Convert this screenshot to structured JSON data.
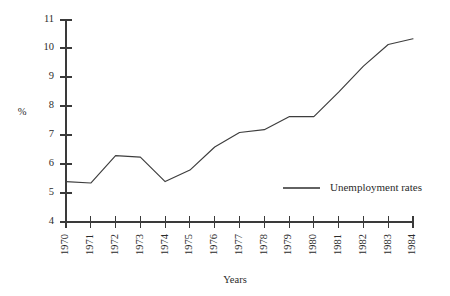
{
  "chart_data": {
    "type": "line",
    "title": "",
    "xlabel": "Years",
    "ylabel": "%",
    "categories": [
      "1970",
      "1971",
      "1972",
      "1973",
      "1974",
      "1975",
      "1976",
      "1977",
      "1978",
      "1979",
      "1980",
      "1981",
      "1982",
      "1983",
      "1984"
    ],
    "series": [
      {
        "name": "Unemployment rates",
        "values": [
          5.4,
          5.35,
          6.3,
          6.25,
          5.4,
          5.8,
          6.6,
          7.1,
          7.2,
          7.65,
          7.65,
          8.5,
          9.4,
          10.15,
          10.35
        ],
        "color": "#3d3d3d"
      }
    ],
    "ylim": [
      4,
      11
    ],
    "yticks": [
      4,
      5,
      6,
      7,
      8,
      9,
      10,
      11
    ],
    "ytick_labels": [
      "4",
      "5",
      "6",
      "7",
      "8",
      "9",
      "10",
      "11"
    ],
    "grid": false,
    "legend_position": "inside-bottom-right",
    "xtick_rotation": -90
  },
  "legend": {
    "entries": [
      {
        "label": "Unemployment rates",
        "marker": "line"
      }
    ]
  },
  "axes": {
    "y_axis_title": "%",
    "x_axis_title": "Years"
  }
}
